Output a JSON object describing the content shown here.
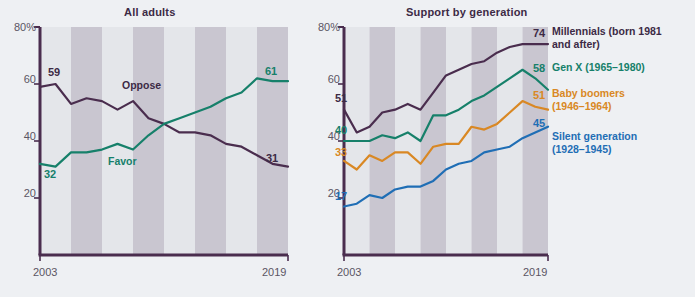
{
  "figure": {
    "background_color": "#eef0f3",
    "band_light": "#e4e6ea",
    "band_dark": "#c9c6d0",
    "axis_color": "#4a2d4e",
    "tick_text_color": "#5b5563"
  },
  "panels": [
    {
      "id": "all-adults",
      "title": "All adults",
      "x_axis": {
        "start_label": "2003",
        "end_label": "2019",
        "min": 2003,
        "max": 2019
      },
      "y_axis": {
        "min": 0,
        "max": 80,
        "ticks": [
          "20",
          "40",
          "60",
          "80%"
        ],
        "tick_values": [
          20,
          40,
          60,
          80
        ]
      }
    },
    {
      "id": "support-by-generation",
      "title": "Support by generation",
      "x_axis": {
        "start_label": "2003",
        "end_label": "2019",
        "min": 2003,
        "max": 2019
      },
      "y_axis": {
        "min": 0,
        "max": 80,
        "ticks": [
          "20",
          "40",
          "60",
          "80%"
        ],
        "tick_values": [
          20,
          40,
          60,
          80
        ]
      }
    }
  ],
  "inline_labels": {
    "oppose": "Oppose",
    "favor": "Favor"
  },
  "endpoint_labels": {
    "oppose_start": "59",
    "oppose_end": "31",
    "favor_start": "32",
    "favor_end": "61",
    "millennials_start": "51",
    "millennials_end": "74",
    "genx_start": "40",
    "genx_end": "58",
    "boomers_start": "33",
    "boomers_end": "51",
    "silent_start": "17",
    "silent_end": "45"
  },
  "legend": [
    {
      "key": "millennials",
      "line1": "Millennials (born 1981",
      "line2": "and after)",
      "color": "#4a2d4e"
    },
    {
      "key": "genx",
      "line1": "Gen X (1965–1980)",
      "line2": "",
      "color": "#16806a"
    },
    {
      "key": "boomers",
      "line1": "Baby boomers",
      "line2": "(1946–1964)",
      "color": "#d98824"
    },
    {
      "key": "silent",
      "line1": "Silent generation",
      "line2": "(1928–1945)",
      "color": "#1f6eb5"
    }
  ],
  "chart_data": [
    {
      "type": "line",
      "title": "All adults",
      "xlabel": "",
      "ylabel": "",
      "xlim": [
        2003,
        2019
      ],
      "ylim": [
        0,
        80
      ],
      "ytick_labels": [
        "20",
        "40",
        "60",
        "80%"
      ],
      "xtick_labels": [
        "2003",
        "2019"
      ],
      "grid": false,
      "legend_position": "inline",
      "x": [
        2003,
        2004,
        2005,
        2006,
        2007,
        2008,
        2009,
        2010,
        2011,
        2012,
        2013,
        2014,
        2015,
        2016,
        2017,
        2018,
        2019
      ],
      "series": [
        {
          "name": "Oppose",
          "color": "#4a2d4e",
          "values": [
            59,
            60,
            53,
            55,
            54,
            51,
            54,
            48,
            46,
            43,
            43,
            42,
            39,
            38,
            35,
            32,
            31
          ],
          "start_label": "59",
          "end_label": "31"
        },
        {
          "name": "Favor",
          "color": "#16806a",
          "values": [
            32,
            31,
            36,
            36,
            37,
            39,
            37,
            42,
            46,
            48,
            50,
            52,
            55,
            57,
            62,
            61,
            61
          ],
          "start_label": "32",
          "end_label": "61"
        }
      ]
    },
    {
      "type": "line",
      "title": "Support by generation",
      "xlabel": "",
      "ylabel": "",
      "xlim": [
        2003,
        2019
      ],
      "ylim": [
        0,
        80
      ],
      "ytick_labels": [
        "20",
        "40",
        "60",
        "80%"
      ],
      "xtick_labels": [
        "2003",
        "2019"
      ],
      "grid": false,
      "legend_position": "right",
      "x": [
        2003,
        2004,
        2005,
        2006,
        2007,
        2008,
        2009,
        2010,
        2011,
        2012,
        2013,
        2014,
        2015,
        2016,
        2017,
        2018,
        2019
      ],
      "series": [
        {
          "name": "Millennials (born 1981 and after)",
          "color": "#4a2d4e",
          "values": [
            51,
            43,
            45,
            50,
            51,
            53,
            51,
            57,
            63,
            65,
            67,
            68,
            71,
            73,
            74,
            74,
            74
          ],
          "start_label": "51",
          "end_label": "74"
        },
        {
          "name": "Gen X (1965–1980)",
          "color": "#16806a",
          "values": [
            40,
            40,
            40,
            42,
            41,
            43,
            40,
            49,
            49,
            51,
            54,
            56,
            59,
            62,
            65,
            62,
            58
          ],
          "start_label": "40",
          "end_label": "58"
        },
        {
          "name": "Baby boomers (1946–1964)",
          "color": "#d98824",
          "values": [
            33,
            30,
            35,
            33,
            36,
            36,
            32,
            38,
            39,
            39,
            45,
            44,
            46,
            50,
            54,
            52,
            51
          ],
          "start_label": "33",
          "end_label": "51"
        },
        {
          "name": "Silent generation (1928–1945)",
          "color": "#1f6eb5",
          "values": [
            17,
            18,
            21,
            20,
            23,
            24,
            24,
            26,
            30,
            32,
            33,
            36,
            37,
            38,
            41,
            43,
            45
          ],
          "start_label": "17",
          "end_label": "45"
        }
      ]
    }
  ]
}
